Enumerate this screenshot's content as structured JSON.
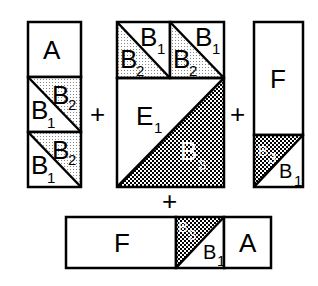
{
  "diagram": {
    "operator": "+",
    "pieces": {
      "left_column": {
        "top_label": "A",
        "triangles": [
          {
            "lower": "B",
            "lower_sub": "1",
            "upper": "B",
            "upper_sub": "2"
          },
          {
            "lower": "B",
            "lower_sub": "1",
            "upper": "B",
            "upper_sub": "2"
          }
        ]
      },
      "center_block": {
        "top_squares": [
          {
            "upper": "B",
            "upper_sub": "1",
            "lower": "B",
            "lower_sub": "2"
          },
          {
            "upper": "B",
            "upper_sub": "1",
            "lower": "B",
            "lower_sub": "2"
          }
        ],
        "big_upper": "E",
        "big_upper_sub": "1",
        "big_lower": "B",
        "big_lower_sub": "3"
      },
      "right_column": {
        "top_label": "F",
        "dark": "B",
        "dark_sub": "3",
        "light": "B",
        "light_sub": "1"
      },
      "bottom_row": {
        "left_label": "F",
        "dark": "B",
        "dark_sub": "3",
        "light": "B",
        "light_sub": "1",
        "right_label": "A"
      }
    }
  }
}
